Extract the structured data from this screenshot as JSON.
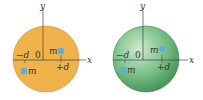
{
  "panels": [
    {
      "name": "left",
      "sphere_color": "#f0b24a",
      "labels": {
        "y_axis": "y",
        "x_axis": "x",
        "origin": "0",
        "neg_d": "−d",
        "pos_d": "+d",
        "mass_upper": "m",
        "mass_lower": "m"
      }
    },
    {
      "name": "right",
      "sphere_color": "#7cc08a",
      "labels": {
        "y_axis": "y",
        "x_axis": "x",
        "origin": "0",
        "neg_d": "−d",
        "pos_d": "+d",
        "mass_upper": "m",
        "mass_lower": "m"
      }
    }
  ],
  "colors": {
    "mass_dot": "#5aaee0",
    "axis": "#444444"
  }
}
